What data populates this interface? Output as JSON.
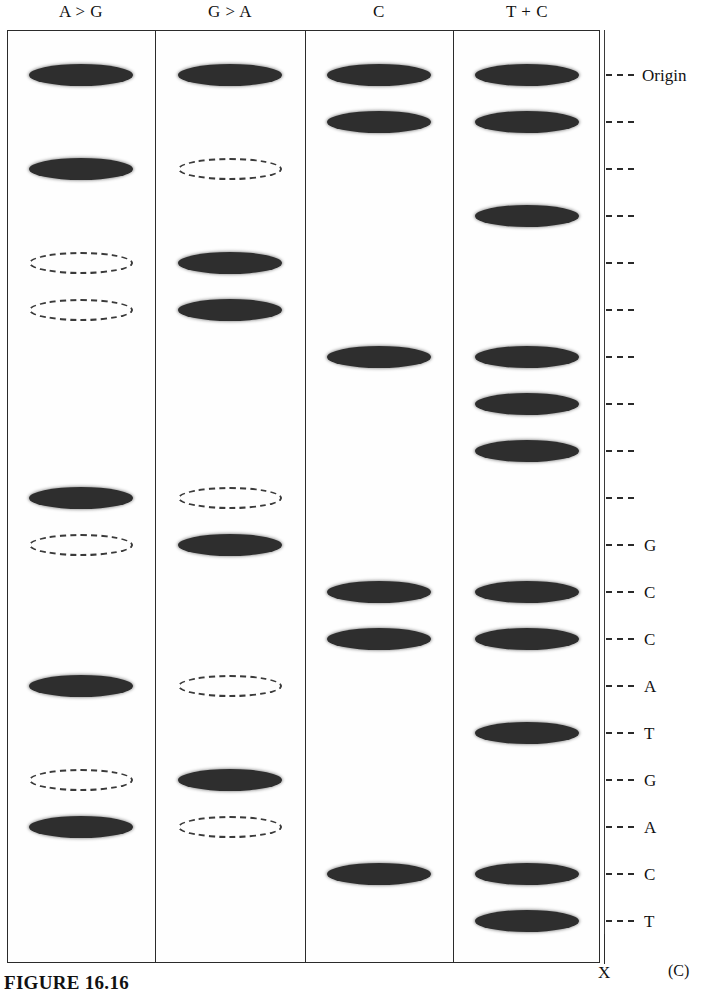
{
  "figure": {
    "caption": "FIGURE 16.16",
    "panel_label": "(C)",
    "origin_label": "Origin",
    "bottom_marker": "X"
  },
  "chart_data": {
    "type": "table",
    "title": "FIGURE 16.16",
    "subtitle": "(C)",
    "lane_labels": [
      "A > G",
      "G > A",
      "C",
      "T + C"
    ],
    "scale_ticks": [
      {
        "y": 75,
        "label": "Origin"
      },
      {
        "y": 122,
        "label": ""
      },
      {
        "y": 169,
        "label": ""
      },
      {
        "y": 216,
        "label": ""
      },
      {
        "y": 263,
        "label": ""
      },
      {
        "y": 310,
        "label": ""
      },
      {
        "y": 357,
        "label": ""
      },
      {
        "y": 404,
        "label": ""
      },
      {
        "y": 451,
        "label": ""
      },
      {
        "y": 498,
        "label": ""
      },
      {
        "y": 545,
        "label": "G"
      },
      {
        "y": 592,
        "label": "C"
      },
      {
        "y": 639,
        "label": "C"
      },
      {
        "y": 686,
        "label": "A"
      },
      {
        "y": 733,
        "label": "T"
      },
      {
        "y": 780,
        "label": "G"
      },
      {
        "y": 827,
        "label": "A"
      },
      {
        "y": 874,
        "label": "C"
      },
      {
        "y": 921,
        "label": "T"
      }
    ],
    "lanes": [
      {
        "name": "A > G",
        "bands": [
          {
            "y": 75,
            "type": "filled"
          },
          {
            "y": 169,
            "type": "filled"
          },
          {
            "y": 263,
            "type": "faint"
          },
          {
            "y": 310,
            "type": "faint"
          },
          {
            "y": 498,
            "type": "filled"
          },
          {
            "y": 545,
            "type": "faint"
          },
          {
            "y": 686,
            "type": "filled"
          },
          {
            "y": 780,
            "type": "faint"
          },
          {
            "y": 827,
            "type": "filled"
          }
        ]
      },
      {
        "name": "G > A",
        "bands": [
          {
            "y": 75,
            "type": "filled"
          },
          {
            "y": 169,
            "type": "faint"
          },
          {
            "y": 263,
            "type": "filled"
          },
          {
            "y": 310,
            "type": "filled"
          },
          {
            "y": 498,
            "type": "faint"
          },
          {
            "y": 545,
            "type": "filled"
          },
          {
            "y": 686,
            "type": "faint"
          },
          {
            "y": 780,
            "type": "filled"
          },
          {
            "y": 827,
            "type": "faint"
          }
        ]
      },
      {
        "name": "C",
        "bands": [
          {
            "y": 75,
            "type": "filled"
          },
          {
            "y": 122,
            "type": "filled"
          },
          {
            "y": 357,
            "type": "filled"
          },
          {
            "y": 592,
            "type": "filled"
          },
          {
            "y": 639,
            "type": "filled"
          },
          {
            "y": 874,
            "type": "filled"
          }
        ]
      },
      {
        "name": "T + C",
        "bands": [
          {
            "y": 75,
            "type": "filled"
          },
          {
            "y": 122,
            "type": "filled"
          },
          {
            "y": 216,
            "type": "filled"
          },
          {
            "y": 357,
            "type": "filled"
          },
          {
            "y": 404,
            "type": "filled"
          },
          {
            "y": 451,
            "type": "filled"
          },
          {
            "y": 592,
            "type": "filled"
          },
          {
            "y": 639,
            "type": "filled"
          },
          {
            "y": 733,
            "type": "filled"
          },
          {
            "y": 874,
            "type": "filled"
          },
          {
            "y": 921,
            "type": "filled"
          }
        ]
      }
    ],
    "read_sequence_bottom_to_top": [
      "T",
      "C",
      "A",
      "G",
      "T",
      "A",
      "C",
      "C",
      "G"
    ],
    "geometry": {
      "frame": {
        "x": 7,
        "y": 30,
        "w": 593,
        "h": 933
      },
      "lane_dividers_x": [
        155,
        305,
        453
      ],
      "lane_centers_x": [
        81,
        230,
        379,
        527
      ],
      "scale_line_x": 604,
      "band_width": 104
    }
  }
}
